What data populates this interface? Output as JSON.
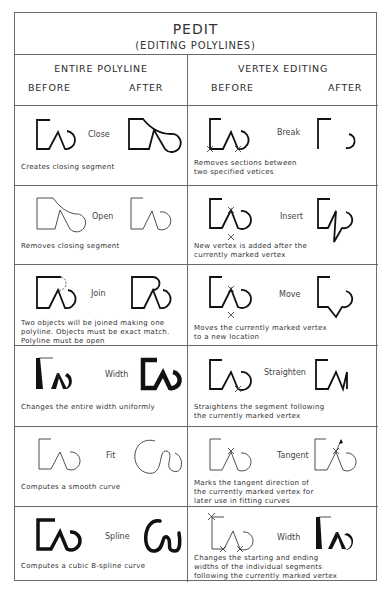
{
  "title": {
    "main": "PEDIT",
    "sub": "(EDITING POLYLINES)"
  },
  "columns": {
    "left": {
      "heading": "ENTIRE POLYLINE",
      "before": "BEFORE",
      "after": "AFTER"
    },
    "right": {
      "heading": "VERTEX EDITING",
      "before": "BEFORE",
      "after": "AFTER"
    }
  },
  "entire_polyline": [
    {
      "operation": "Close",
      "description": "Creates closing segment"
    },
    {
      "operation": "Open",
      "description": "Removes closing segment"
    },
    {
      "operation": "Join",
      "description": "Two objects will be joined making one\npolyline.  Objects must be exact match.\nPolyline must be open"
    },
    {
      "operation": "Width",
      "description": "Changes the entire width uniformly"
    },
    {
      "operation": "Fit",
      "description": "Computes a smooth curve"
    },
    {
      "operation": "Spline",
      "description": "Computes a cubic B-spline curve"
    }
  ],
  "vertex_editing": [
    {
      "operation": "Break",
      "description": "Removes sections between\ntwo specified vetices"
    },
    {
      "operation": "Insert",
      "description": "New vertex is added after the\ncurrently marked vertex"
    },
    {
      "operation": "Move",
      "description": "Moves the currently marked vertex\nto a new location"
    },
    {
      "operation": "Straighten",
      "description": "Straightens the segment following\nthe currently marked vertex"
    },
    {
      "operation": "Tangent",
      "description": "Marks the tangent direction of\nthe currently marked vertex for\nlater use in fitting curves"
    },
    {
      "operation": "Width",
      "description": "Changes the starting and ending\nwidths of the individual segments\nfollowing the currently marked vertex"
    }
  ]
}
